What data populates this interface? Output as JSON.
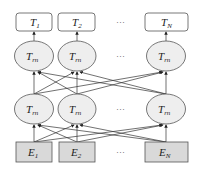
{
  "outputs": [
    {
      "base": "T",
      "sub": "1"
    },
    {
      "base": "T",
      "sub": "2"
    },
    {
      "base": "T",
      "sub": "N"
    }
  ],
  "hidden_top": [
    {
      "base": "T",
      "sub": "rn"
    },
    {
      "base": "T",
      "sub": "rn"
    },
    {
      "base": "T",
      "sub": "rn"
    }
  ],
  "hidden_bottom": [
    {
      "base": "T",
      "sub": "rn"
    },
    {
      "base": "T",
      "sub": "rn"
    },
    {
      "base": "T",
      "sub": "rn"
    }
  ],
  "inputs": [
    {
      "base": "E",
      "sub": "1"
    },
    {
      "base": "E",
      "sub": "2"
    },
    {
      "base": "E",
      "sub": "N"
    }
  ],
  "ellipsis": "···",
  "colors": {
    "stroke": "#555555",
    "ellipse_fill": "#eeeeee",
    "input_fill": "#d9d9d9",
    "output_fill": "#ffffff"
  }
}
